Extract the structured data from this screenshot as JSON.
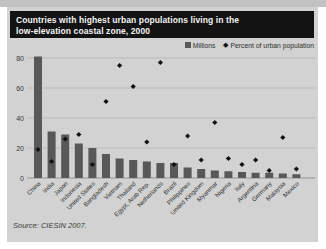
{
  "panel": {
    "title_line1": "Countries with highest urban populations living in the",
    "title_line2": "low-elevation coastal zone, 2000",
    "source": "Source: CIESIN 2007."
  },
  "legend": {
    "millions_label": "Millions",
    "percent_label": "Percent of urban population"
  },
  "colors": {
    "scan_strip": "#c2c2c2",
    "panel_bg": "#d2d2d2",
    "title_bg": "#131313",
    "title_text": "#f4f4f4",
    "bar": "#585858",
    "diamond": "#111111",
    "gridline": "#b3b3b3",
    "baseline": "#8c8c8c",
    "axis_text": "#3a3a3a"
  },
  "chart_data": {
    "type": "bar",
    "title": "Countries with highest urban populations living in the low-elevation coastal zone, 2000",
    "categories": [
      "China",
      "India",
      "Japan",
      "Indonesia",
      "United States",
      "Bangladesh",
      "Vietnam",
      "Thailand",
      "Egypt, Arab Rep.",
      "Netherlands",
      "Brazil",
      "Philippines",
      "United Kingdom",
      "Myanmar",
      "Nigeria",
      "Italy",
      "Argentina",
      "Germany",
      "Malaysia",
      "Mexico"
    ],
    "series": [
      {
        "name": "Millions",
        "type": "bar",
        "values": [
          81,
          31,
          29,
          23,
          20,
          16,
          13,
          12,
          11,
          10,
          10,
          7,
          6,
          5,
          4.5,
          4,
          3.5,
          3.5,
          3,
          2.5
        ]
      },
      {
        "name": "Percent of urban population",
        "type": "scatter",
        "values": [
          19,
          11,
          26,
          29,
          9,
          51,
          75,
          61,
          24,
          77,
          9,
          28,
          12,
          37,
          13,
          9,
          12,
          5,
          27,
          6
        ]
      }
    ],
    "xlabel": "",
    "ylabel": "",
    "ylim": [
      0,
      85
    ],
    "yticks": [
      0,
      20,
      40,
      60,
      80
    ],
    "grid": true,
    "legend_position": "top-right"
  }
}
